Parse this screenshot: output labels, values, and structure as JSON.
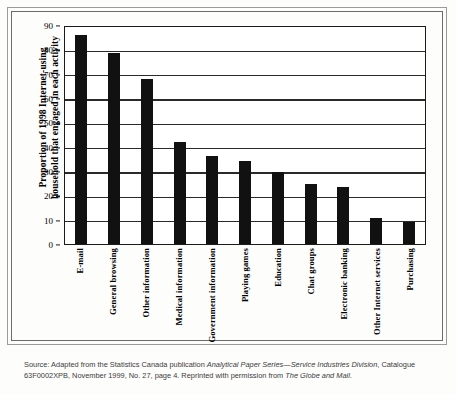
{
  "chart_data": {
    "type": "bar",
    "title": "",
    "subtitle": "",
    "xlabel": "",
    "ylabel": "Proportion of 1998 Internet-using\nhousehold that engaged in each activity",
    "ylim": [
      0,
      90
    ],
    "y_ticks": [
      0,
      10,
      20,
      30,
      40,
      50,
      60,
      70,
      80,
      90
    ],
    "grid": true,
    "legend": "none",
    "bar_color": "#111111",
    "categories": [
      "E-mail",
      "General browsing",
      "Other information",
      "Medical information",
      "Government information",
      "Playing games",
      "Education",
      "Chat groups",
      "Electronic banking",
      "Other Internet services",
      "Purchasing"
    ],
    "values": [
      86,
      78.5,
      68,
      42,
      36,
      34,
      29.5,
      24.5,
      23.5,
      10.5,
      9
    ]
  },
  "source": {
    "line1_prefix": "Source: Adapted from the Statistics Canada publication ",
    "line1_italic": "Analytical Paper Series—Service Industries Division",
    "line1_suffix": ",",
    "line2_prefix": "Catalogue 63F0002XPB, November 1999, No. 27, page 4. Reprinted with permission from ",
    "line2_italic": "The Globe and Mail",
    "line2_suffix": "."
  }
}
